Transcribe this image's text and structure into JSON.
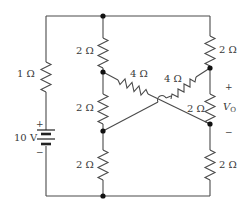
{
  "diagram": {
    "type": "circuit",
    "source": {
      "label": "10 V",
      "plus": "+",
      "minus": "−"
    },
    "resistors": [
      {
        "id": "R_left",
        "label": "1 Ω"
      },
      {
        "id": "R_mid_top",
        "label": "2 Ω"
      },
      {
        "id": "R_mid_center",
        "label": "2 Ω"
      },
      {
        "id": "R_mid_bottom",
        "label": "2 Ω"
      },
      {
        "id": "R_right_top",
        "label": "2 Ω"
      },
      {
        "id": "R_right_center",
        "label": "2 Ω"
      },
      {
        "id": "R_right_bottom",
        "label": "2 Ω"
      },
      {
        "id": "R_diag_left",
        "label": "4 Ω"
      },
      {
        "id": "R_diag_right",
        "label": "4 Ω"
      }
    ],
    "output": {
      "label_main": "V",
      "label_sub": "O",
      "plus": "+",
      "minus": "−"
    },
    "colors": {
      "wire": "#4a4a4a",
      "node": "#111111",
      "text": "#3a3a3a"
    }
  }
}
